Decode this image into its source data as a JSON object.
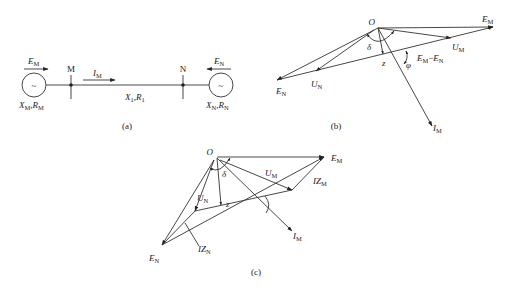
{
  "figure": {
    "panels": {
      "a": {
        "caption": "(a)",
        "bus_M": "M",
        "bus_N": "N",
        "source_M_emf": "E",
        "source_M_emf_sub": "M",
        "source_N_emf": "E",
        "source_N_emf_sub": "N",
        "current": "I",
        "current_sub": "M",
        "source_symbol": "~",
        "impedance_M": "X",
        "impedance_M_sub": "M",
        "impedance_M_r": "R",
        "impedance_M_r_sub": "M",
        "impedance_N": "X",
        "impedance_N_sub": "N",
        "impedance_N_r": "R",
        "impedance_N_r_sub": "N",
        "line_x": "X",
        "line_x_sub": "1",
        "line_r": "R",
        "line_r_sub": "1",
        "comma": ","
      },
      "b": {
        "caption": "(b)",
        "origin": "O",
        "delta": "δ",
        "phi": "φ",
        "z": "z",
        "E_M": "E",
        "E_M_sub": "M",
        "E_N": "E",
        "E_N_sub": "N",
        "U_M": "U",
        "U_M_sub": "M",
        "U_N": "U",
        "U_N_sub": "N",
        "I_M": "I",
        "I_M_sub": "M",
        "diff_a": "E",
        "diff_a_sub": "M",
        "diff_minus": "−",
        "diff_b": "E",
        "diff_b_sub": "N"
      },
      "c": {
        "caption": "(c)",
        "origin": "O",
        "delta": "δ",
        "z": "z",
        "E_M": "E",
        "E_M_sub": "M",
        "E_N": "E",
        "E_N_sub": "N",
        "U_M": "U",
        "U_M_sub": "M",
        "U_N": "U",
        "U_N_sub": "N",
        "I_M": "I",
        "I_M_sub": "M",
        "IZ_M": "IZ",
        "IZ_M_sub": "M",
        "IZ_N": "IZ",
        "IZ_N_sub": "N"
      }
    }
  }
}
